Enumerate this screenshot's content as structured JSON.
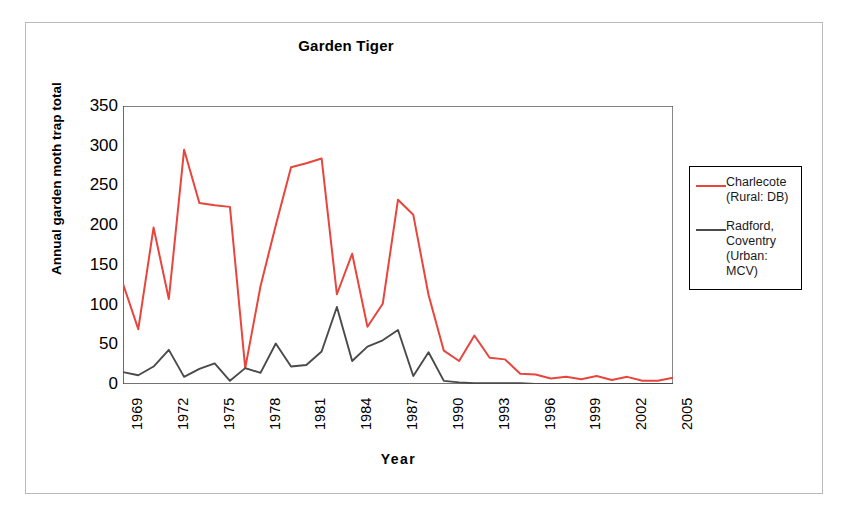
{
  "figure": {
    "title": "Garden Tiger",
    "xlabel": "Year",
    "ylabel": "Annual garden moth trap total"
  },
  "legend": {
    "entries": [
      {
        "label": "Charlecote\n(Rural: DB)",
        "color": "#E8453C",
        "name": "charlecote"
      },
      {
        "label": "Radford,\nCoventry\n(Urban:\nMCV)",
        "color": "#4A4A4A",
        "name": "radford-coventry"
      }
    ]
  },
  "chart_data": {
    "type": "line",
    "title": "Garden Tiger",
    "xlabel": "Year",
    "ylabel": "Annual garden moth trap total",
    "grid": false,
    "legend_position": "right",
    "xlim": [
      1969,
      2005
    ],
    "ylim": [
      0,
      350
    ],
    "yticks": [
      0,
      50,
      100,
      150,
      200,
      250,
      300,
      350
    ],
    "xtick_labels": [
      "1969",
      "1972",
      "1975",
      "1978",
      "1981",
      "1984",
      "1987",
      "1990",
      "1993",
      "1996",
      "1999",
      "2002",
      "2005"
    ],
    "x": [
      1969,
      1970,
      1971,
      1972,
      1973,
      1974,
      1975,
      1976,
      1977,
      1978,
      1979,
      1980,
      1981,
      1982,
      1983,
      1984,
      1985,
      1986,
      1987,
      1988,
      1989,
      1990,
      1991,
      1992,
      1993,
      1994,
      1995,
      1996,
      1997,
      1998,
      1999,
      2000,
      2001,
      2002,
      2003,
      2004,
      2005
    ],
    "series": [
      {
        "name": "Charlecote (Rural: DB)",
        "color": "#E8453C",
        "values": [
          126,
          69,
          197,
          107,
          295,
          228,
          225,
          223,
          20,
          123,
          200,
          273,
          278,
          284,
          113,
          164,
          72,
          101,
          232,
          213,
          112,
          42,
          29,
          61,
          33,
          31,
          13,
          12,
          7,
          9,
          6,
          10,
          5,
          9,
          4,
          4,
          8
        ]
      },
      {
        "name": "Radford, Coventry (Urban: MCV)",
        "color": "#4A4A4A",
        "values": [
          15,
          11,
          22,
          43,
          9,
          19,
          26,
          4,
          20,
          14,
          51,
          22,
          24,
          41,
          97,
          29,
          47,
          55,
          68,
          10,
          40,
          4,
          2,
          1,
          1,
          1,
          1,
          0,
          0,
          0,
          0,
          0,
          0,
          0,
          0,
          0,
          0
        ]
      }
    ]
  }
}
